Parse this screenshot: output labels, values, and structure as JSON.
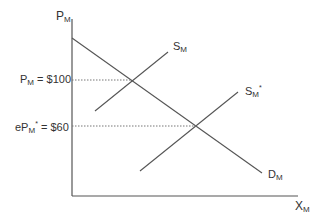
{
  "diagram": {
    "type": "supply-demand",
    "axes": {
      "y_label": {
        "main": "P",
        "sub": "M"
      },
      "x_label": {
        "main": "X",
        "sub": "M"
      }
    },
    "curves": {
      "supply": {
        "main": "S",
        "sub": "M",
        "sup": ""
      },
      "supply_shifted": {
        "main": "S",
        "sub": "M",
        "sup": "*"
      },
      "demand": {
        "main": "D",
        "sub": "M",
        "sup": ""
      }
    },
    "price_labels": {
      "original": {
        "prefix": "P",
        "sub": "M",
        "sup": "",
        "value": " = $100"
      },
      "new": {
        "prefix": "eP",
        "sub": "M",
        "sup": "*",
        "value": " = $60"
      }
    },
    "colors": {
      "line": "#555555",
      "text": "#333333",
      "dotted": "#777777"
    }
  }
}
